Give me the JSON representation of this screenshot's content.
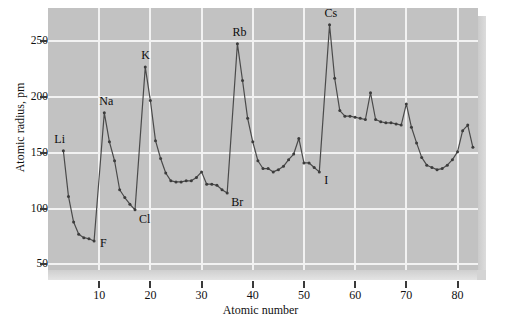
{
  "figure": {
    "panel_bg": "#c2c2c2",
    "grid_color": "#f2f2f2",
    "line_color": "#4a4a4a",
    "marker_color": "#3c3c3c"
  },
  "axes": {
    "x_title": "Atomic number",
    "y_title": "Atomic radius, pm",
    "x_ticks": [
      "10",
      "20",
      "30",
      "40",
      "50",
      "60",
      "70",
      "80"
    ],
    "y_ticks": [
      "50",
      "100",
      "150",
      "200",
      "250"
    ]
  },
  "annotations": [
    {
      "name": "Li",
      "text": "Li",
      "x": 3,
      "y": 152,
      "dx": -9,
      "dy": -18
    },
    {
      "name": "F",
      "text": "F",
      "x": 9,
      "y": 71,
      "dx": 6,
      "dy": -4
    },
    {
      "name": "Na",
      "text": "Na",
      "x": 11,
      "y": 186,
      "dx": -5,
      "dy": -18
    },
    {
      "name": "Cl",
      "text": "Cl",
      "x": 17,
      "y": 99,
      "dx": 4,
      "dy": 3
    },
    {
      "name": "K",
      "text": "K",
      "x": 19,
      "y": 227,
      "dx": -4,
      "dy": -18
    },
    {
      "name": "Br",
      "text": "Br",
      "x": 35,
      "y": 114,
      "dx": 4,
      "dy": 3
    },
    {
      "name": "Rb",
      "text": "Rb",
      "x": 37,
      "y": 248,
      "dx": -5,
      "dy": -18
    },
    {
      "name": "I",
      "text": "I",
      "x": 53,
      "y": 133,
      "dx": 5,
      "dy": 2
    },
    {
      "name": "Cs",
      "text": "Cs",
      "x": 55,
      "y": 265,
      "dx": -5,
      "dy": -18
    }
  ],
  "chart_data": {
    "type": "line",
    "title": "",
    "xlabel": "Atomic number",
    "ylabel": "Atomic radius, pm",
    "xlim": [
      0,
      84
    ],
    "ylim": [
      45,
      280
    ],
    "grid": true,
    "legend": false,
    "markers": true,
    "series": [
      {
        "name": "Atomic radius",
        "x": [
          3,
          4,
          5,
          6,
          7,
          8,
          9,
          11,
          12,
          13,
          14,
          15,
          16,
          17,
          19,
          20,
          21,
          22,
          23,
          24,
          25,
          26,
          27,
          28,
          29,
          30,
          31,
          32,
          33,
          34,
          35,
          37,
          38,
          39,
          40,
          41,
          42,
          43,
          44,
          45,
          46,
          47,
          48,
          49,
          50,
          51,
          52,
          53,
          55,
          56,
          57,
          58,
          59,
          60,
          61,
          62,
          63,
          64,
          65,
          66,
          67,
          68,
          69,
          70,
          71,
          72,
          73,
          74,
          75,
          76,
          77,
          78,
          79,
          80,
          81,
          82,
          83
        ],
        "y": [
          152,
          111,
          88,
          77,
          74,
          73,
          71,
          186,
          160,
          143,
          117,
          110,
          104,
          99,
          227,
          197,
          161,
          145,
          132,
          125,
          124,
          124,
          125,
          125,
          128,
          133,
          122,
          122,
          121,
          117,
          114,
          248,
          215,
          181,
          160,
          143,
          136,
          136,
          133,
          135,
          138,
          144,
          149,
          163,
          141,
          141,
          137,
          133,
          265,
          217,
          188,
          183,
          183,
          182,
          181,
          180,
          204,
          180,
          178,
          177,
          177,
          176,
          175,
          194,
          173,
          159,
          146,
          139,
          137,
          135,
          136,
          139,
          144,
          151,
          170,
          175,
          155
        ]
      }
    ]
  }
}
